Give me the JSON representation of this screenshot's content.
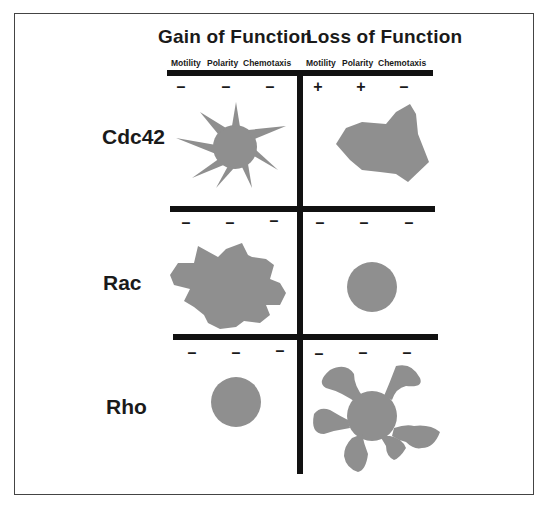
{
  "figure": {
    "titles": {
      "gain": "Gain of Function",
      "loss": "Loss of Function"
    },
    "columns": {
      "gain": [
        "Motility",
        "Polarity",
        "Chemotaxis"
      ],
      "loss": [
        "Motility",
        "Polarity",
        "Chemotaxis"
      ]
    },
    "rows": [
      {
        "label": "Cdc42",
        "gain_signs": [
          "–",
          "–",
          "–"
        ],
        "loss_signs": [
          "+",
          "+",
          "–"
        ],
        "gain_shape": "spiky-star-cell",
        "loss_shape": "irregular-polygon-cell"
      },
      {
        "label": "Rac",
        "gain_signs": [
          "–",
          "–",
          "–"
        ],
        "loss_signs": [
          "–",
          "–",
          "–"
        ],
        "gain_shape": "ruffled-lamellipodia-cell",
        "loss_shape": "round-cell"
      },
      {
        "label": "Rho",
        "gain_signs": [
          "–",
          "–",
          "–"
        ],
        "loss_signs": [
          "–",
          "–",
          "–"
        ],
        "gain_shape": "round-cell",
        "loss_shape": "lobed-protrusion-cell"
      }
    ],
    "colors": {
      "cell_fill": "#8f8f8f",
      "lines": "#111111"
    }
  }
}
